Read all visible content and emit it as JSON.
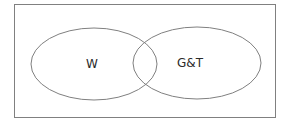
{
  "diagram": {
    "type": "venn",
    "sets": [
      {
        "label": "W"
      },
      {
        "label": "G&T"
      }
    ],
    "colors": {
      "stroke": "#808080",
      "text": "#2a2a2a",
      "background": "#ffffff"
    }
  }
}
